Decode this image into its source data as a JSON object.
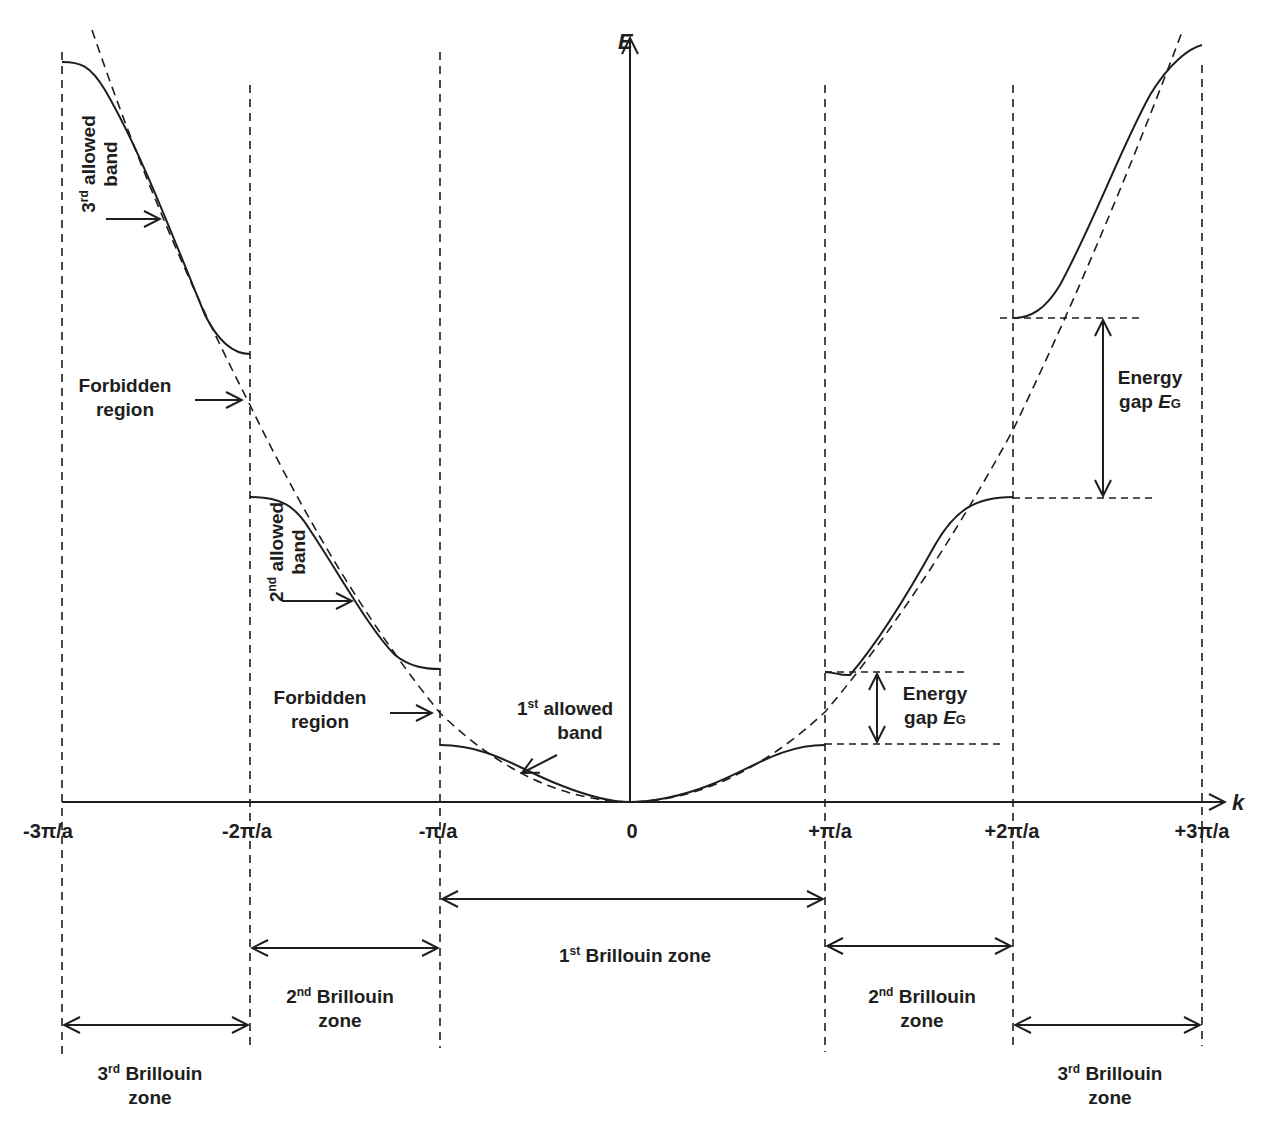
{
  "axes": {
    "y_label": "E",
    "x_label": "k",
    "x_ticks": [
      "-3π/a",
      "-2π/a",
      "-π/a",
      "0",
      "+π/a",
      "+2π/a",
      "+3π/a"
    ]
  },
  "bands": {
    "first": {
      "ord": "1",
      "sup": "st",
      "line1": "allowed",
      "line2": "band"
    },
    "second": {
      "ord": "2",
      "sup": "nd",
      "text1": "allowed",
      "text2": "band"
    },
    "third": {
      "ord": "3",
      "sup": "rd",
      "text1": "allowed",
      "text2": "band"
    }
  },
  "forbidden": {
    "upper": {
      "line1": "Forbidden",
      "line2": "region"
    },
    "lower": {
      "line1": "Forbidden",
      "line2": "region"
    }
  },
  "energy_gap": {
    "small": {
      "line1": "Energy",
      "line2_prefix": "gap ",
      "symbol": "E",
      "subscript": "G"
    },
    "large": {
      "line1": "Energy",
      "line2_prefix": "gap ",
      "symbol": "E",
      "subscript": "G"
    }
  },
  "zones": {
    "first": {
      "ord": "1",
      "sup": "st",
      "text": "Brillouin zone"
    },
    "second_left": {
      "ord": "2",
      "sup": "nd",
      "line1": "Brillouin",
      "line2": "zone"
    },
    "second_right": {
      "ord": "2",
      "sup": "nd",
      "line1": "Brillouin",
      "line2": "zone"
    },
    "third_left": {
      "ord": "3",
      "sup": "rd",
      "line1": "Brillouin",
      "line2": "zone"
    },
    "third_right": {
      "ord": "3",
      "sup": "rd",
      "line1": "Brillouin",
      "line2": "zone"
    }
  },
  "colors": {
    "ink": "#1e1e1e",
    "background": "#ffffff"
  }
}
